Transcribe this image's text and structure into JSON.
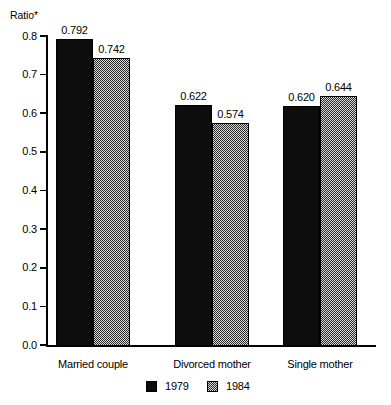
{
  "chart_data": {
    "type": "bar",
    "title": "",
    "subtitle": "",
    "xlabel": "",
    "ylabel": "Ratio*",
    "ylim": [
      0.0,
      0.8
    ],
    "grid": false,
    "legend_position": "bottom",
    "categories": [
      "Married couple",
      "Divorced mother",
      "Single mother"
    ],
    "y_ticks": [
      "0.0",
      "0.1",
      "0.2",
      "0.3",
      "0.4",
      "0.5",
      "0.6",
      "0.7",
      "0.8"
    ],
    "y_tick_values": [
      0.0,
      0.1,
      0.2,
      0.3,
      0.4,
      0.5,
      0.6,
      0.7,
      0.8
    ],
    "series": [
      {
        "name": "1979",
        "color": "#0d0d0d",
        "fill": "solid-black",
        "values": [
          0.792,
          0.622,
          0.62
        ],
        "labels": [
          "0.792",
          "0.622",
          "0.620"
        ]
      },
      {
        "name": "1984",
        "color": "#808080",
        "fill": "checkered-gray",
        "values": [
          0.742,
          0.574,
          0.644
        ],
        "labels": [
          "0.742",
          "0.574",
          "0.644"
        ]
      }
    ]
  },
  "axis": {
    "y_title": "Ratio*"
  },
  "legend": {
    "items": [
      {
        "label": "1979"
      },
      {
        "label": "1984"
      }
    ]
  },
  "footnote": {
    "text": ""
  }
}
